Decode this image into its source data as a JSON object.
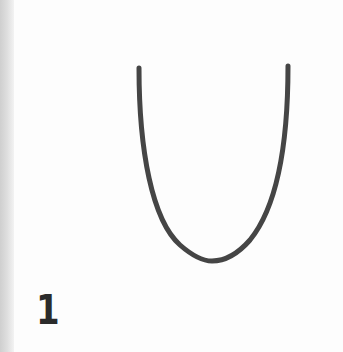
{
  "card": {
    "label": "1",
    "shape": "u-curve",
    "stroke_color": "#454545",
    "label_color": "#2b2b2b",
    "background_color": "#fdfdfd"
  }
}
